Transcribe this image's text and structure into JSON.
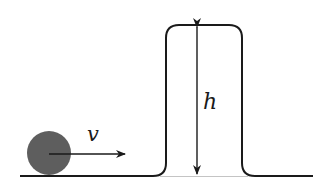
{
  "diagram": {
    "type": "physics-schematic",
    "labels": {
      "velocity": "v",
      "height": "h"
    },
    "elements": {
      "ball": {
        "cx": 49,
        "cy": 153,
        "r": 22,
        "fill": "#5e5e5e"
      },
      "velocity_arrow": {
        "x1": 49,
        "y1": 154,
        "x2": 125,
        "y2": 154
      },
      "ground": {
        "y": 176,
        "x_start": 20,
        "x_end": 313
      },
      "bump": {
        "left_x": 167,
        "right_x": 240,
        "top_y": 25,
        "base_y": 176
      },
      "height_arrow": {
        "x": 197,
        "y_top": 25,
        "y_bottom": 176
      }
    },
    "colors": {
      "stroke": "#1a1a1a",
      "ball": "#5e5e5e",
      "baseline_under_bump": "#bdbdbd"
    }
  }
}
